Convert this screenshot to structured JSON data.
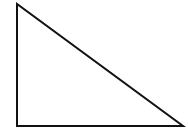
{
  "figure": {
    "type": "right-triangle",
    "points": "17,4 17,126 183,126",
    "vertices": {
      "apex_top_left": [
        17,
        4
      ],
      "right_angle_bottom_left": [
        17,
        126
      ],
      "bottom_right": [
        183,
        126
      ]
    },
    "stroke_color": "#111111",
    "stroke_width": 2,
    "background_color": "#ffffff",
    "canvas": {
      "width": 188,
      "height": 135
    }
  }
}
